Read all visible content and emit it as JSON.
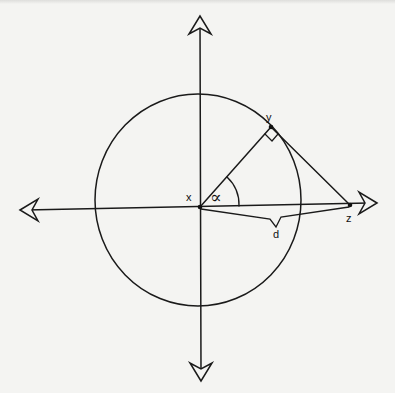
{
  "diagram": {
    "type": "geometry",
    "colors": {
      "background": "#f4f4f2",
      "stroke": "#1a1a1a"
    },
    "points": {
      "x": {
        "label": "x",
        "role": "center / origin"
      },
      "y": {
        "label": "y",
        "role": "point on circle"
      },
      "z": {
        "label": "z",
        "role": "point on horizontal axis"
      }
    },
    "angle": {
      "label": "∝",
      "between": [
        "xz",
        "xy"
      ]
    },
    "distance": {
      "label": "d",
      "from": "x",
      "to": "z"
    },
    "right_angle_at": "y",
    "axes": {
      "horizontal": "double-headed arrow",
      "vertical": "double-headed arrow"
    },
    "circle": {
      "center": "x"
    }
  }
}
